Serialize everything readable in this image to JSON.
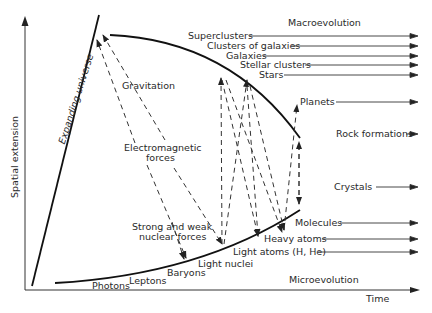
{
  "diagram": {
    "axes": {
      "y_label": "Spatial extension",
      "x_label": "Time"
    },
    "expanding_universe_label": "Expanding universe",
    "macro_title": "Macroevolution",
    "micro_title": "Microevolution",
    "macro_levels": [
      "Superclusters",
      "Clusters of galaxies",
      "Galaxies",
      "Stellar clusters",
      "Stars",
      "Planets",
      "Rock formations"
    ],
    "micro_levels": [
      "Crystals",
      "Molecules",
      "Heavy atoms",
      "Light atoms (H, He)",
      "Light nuclei",
      "Baryons",
      "Leptons",
      "Photons"
    ],
    "forces": [
      "Gravitation",
      "Electromagnetic forces",
      "Strong and weak nuclear forces"
    ],
    "force_labels": {
      "gravitation": "Gravitation",
      "em_line1": "Electromagnetic",
      "em_line2": "forces",
      "nuclear_line1": "Strong and weak",
      "nuclear_line2": "nuclear forces"
    }
  }
}
